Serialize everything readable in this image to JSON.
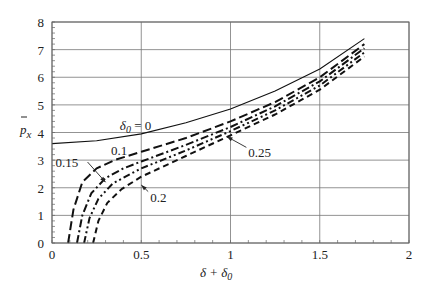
{
  "chart_data": {
    "type": "line",
    "title": "",
    "xlabel": "δ + δ0",
    "ylabel": "p̄x",
    "xlim": [
      0,
      2
    ],
    "ylim": [
      0,
      8
    ],
    "grid": true,
    "x_ticks": [
      "0",
      "0.5",
      "1",
      "1.5",
      "2"
    ],
    "y_ticks": [
      "0",
      "1",
      "2",
      "3",
      "4",
      "5",
      "6",
      "7",
      "8"
    ],
    "series": [
      {
        "name": "δ0 = 0",
        "style": "solid",
        "x": [
          0,
          0.25,
          0.5,
          0.75,
          1.0,
          1.25,
          1.5,
          1.75
        ],
        "y": [
          3.6,
          3.7,
          3.95,
          4.35,
          4.85,
          5.5,
          6.3,
          7.4
        ]
      },
      {
        "name": "0.1",
        "style": "long-dash",
        "x": [
          0.09,
          0.12,
          0.17,
          0.25,
          0.35,
          0.5,
          0.75,
          1.0,
          1.25,
          1.5,
          1.75
        ],
        "y": [
          0,
          1.2,
          2.2,
          2.7,
          3.0,
          3.3,
          3.8,
          4.4,
          5.1,
          6.0,
          7.2
        ]
      },
      {
        "name": "0.15",
        "style": "dash-dot",
        "x": [
          0.14,
          0.17,
          0.22,
          0.3,
          0.4,
          0.5,
          0.75,
          1.0,
          1.25,
          1.5,
          1.75
        ],
        "y": [
          0,
          1.0,
          1.8,
          2.35,
          2.7,
          2.95,
          3.55,
          4.2,
          4.95,
          5.85,
          7.05
        ]
      },
      {
        "name": "0.2",
        "style": "dash-dot-dot",
        "x": [
          0.18,
          0.21,
          0.26,
          0.34,
          0.44,
          0.5,
          0.75,
          1.0,
          1.25,
          1.5,
          1.75
        ],
        "y": [
          0,
          0.9,
          1.6,
          2.15,
          2.5,
          2.7,
          3.35,
          4.05,
          4.8,
          5.7,
          6.9
        ]
      },
      {
        "name": "0.25",
        "style": "dash",
        "x": [
          0.23,
          0.26,
          0.31,
          0.39,
          0.5,
          0.75,
          1.0,
          1.25,
          1.5,
          1.75
        ],
        "y": [
          0,
          0.8,
          1.45,
          1.95,
          2.4,
          3.15,
          3.9,
          4.65,
          5.55,
          6.75
        ]
      }
    ],
    "annotations": [
      {
        "text": "δ0 = 0",
        "x": 0.38,
        "y": 4.1
      },
      {
        "text": "0.1",
        "x": 0.33,
        "y": 3.2
      },
      {
        "text": "0.15",
        "x": 0.02,
        "y": 2.75,
        "arrow_to": [
          0.3,
          2.2
        ]
      },
      {
        "text": "0.2",
        "x": 0.55,
        "y": 1.5,
        "arrow_to": [
          0.5,
          2.1
        ]
      },
      {
        "text": "0.25",
        "x": 1.1,
        "y": 3.1,
        "arrow_to": [
          0.98,
          3.85
        ]
      }
    ]
  },
  "labels": {
    "ylabel_p": "p",
    "ylabel_sub": "x",
    "xlabel_delta": "δ + δ",
    "xlabel_sub": "0"
  }
}
